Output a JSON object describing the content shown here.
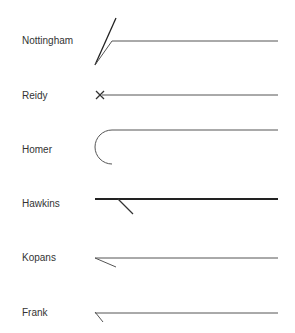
{
  "diagram": {
    "rows": [
      {
        "name": "Nottingham",
        "label_y": 35
      },
      {
        "name": "Reidy",
        "label_y": 90
      },
      {
        "name": "Homer",
        "label_y": 144
      },
      {
        "name": "Hawkins",
        "label_y": 198
      },
      {
        "name": "Kopans",
        "label_y": 252
      },
      {
        "name": "Frank",
        "label_y": 307
      }
    ],
    "line_color": "#555555",
    "thick_line_color": "#222222"
  }
}
